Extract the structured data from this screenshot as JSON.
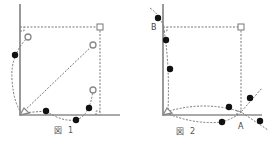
{
  "figures": [
    {
      "caption_mark": "図",
      "caption_num": "1",
      "points_open": 3,
      "points_filled": 4
    },
    {
      "caption_mark": "図",
      "caption_num": "2",
      "label_a": "A",
      "label_b": "B",
      "points_filled": 7
    }
  ],
  "colors": {
    "axis": "#555555",
    "dash": "#777777",
    "dot": "#111111"
  }
}
